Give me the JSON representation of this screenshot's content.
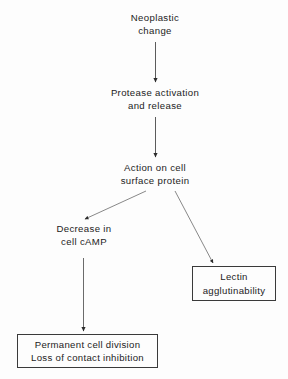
{
  "diagram": {
    "type": "flowchart",
    "title": "",
    "background_color": "#fdfdfd",
    "line_color": "#3a3a3a",
    "text_color": "#1c1c1c",
    "nodes": [
      {
        "id": "neoplastic",
        "shape": "plain-text",
        "lines": [
          "Neoplastic",
          "change"
        ]
      },
      {
        "id": "protease",
        "shape": "plain-text",
        "lines": [
          "Protease activation",
          "and release"
        ]
      },
      {
        "id": "action",
        "shape": "plain-text",
        "lines": [
          "Action on cell",
          "surface protein"
        ]
      },
      {
        "id": "camp",
        "shape": "plain-text",
        "lines": [
          "Decrease in",
          "cell cAMP"
        ]
      },
      {
        "id": "lectin",
        "shape": "rectangle",
        "lines": [
          "Lectin",
          "agglutinability"
        ]
      },
      {
        "id": "permanent",
        "shape": "rectangle",
        "lines": [
          "Permanent cell division",
          "Loss of contact inhibition"
        ]
      }
    ],
    "edges": [
      {
        "id": "e1",
        "from": "neoplastic",
        "to": "protease",
        "style": "straight-vertical",
        "arrowhead": "filled-triangle"
      },
      {
        "id": "e2",
        "from": "protease",
        "to": "action",
        "style": "straight-vertical",
        "arrowhead": "filled-triangle"
      },
      {
        "id": "e3",
        "from": "action",
        "to": "camp",
        "style": "diagonal-left",
        "arrowhead": "filled-triangle"
      },
      {
        "id": "e4",
        "from": "action",
        "to": "lectin",
        "style": "diagonal-right",
        "arrowhead": "filled-triangle"
      },
      {
        "id": "e5",
        "from": "camp",
        "to": "permanent",
        "style": "straight-vertical",
        "arrowhead": "filled-triangle"
      }
    ]
  }
}
